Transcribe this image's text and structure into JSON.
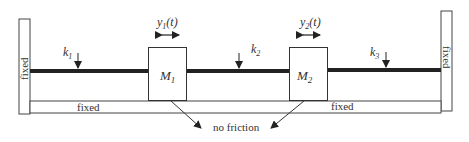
{
  "diagram": {
    "type": "two-mass spring system",
    "walls": {
      "left_label": "fixed",
      "right_label": "fixed",
      "floor_left_label": "fixed",
      "floor_right_label": "fixed"
    },
    "springs": [
      {
        "label": "k",
        "sub": "1"
      },
      {
        "label": "k",
        "sub": "2"
      },
      {
        "label": "k",
        "sub": "3"
      }
    ],
    "masses": [
      {
        "label": "M",
        "sub": "1",
        "displacement": {
          "var": "y",
          "sub": "1",
          "arg": "(t)"
        }
      },
      {
        "label": "M",
        "sub": "2",
        "displacement": {
          "var": "y",
          "sub": "2",
          "arg": "(t)"
        }
      }
    ],
    "annotation": "no friction",
    "colors": {
      "line": "#222222",
      "text": "#333333",
      "background": "#ffffff"
    }
  }
}
